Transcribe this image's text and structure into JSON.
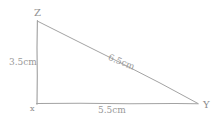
{
  "diagram": {
    "kind": "hand-drawn-right-triangle",
    "background_color": "#ffffff",
    "ink_color": "#a0a0a0",
    "vertices": [
      {
        "id": "z",
        "label": "Z",
        "x": 37,
        "y": 21
      },
      {
        "id": "x",
        "label": "x",
        "x": 37,
        "y": 104
      },
      {
        "id": "y",
        "label": "Y",
        "x": 198,
        "y": 104
      }
    ],
    "sides": [
      {
        "id": "zx",
        "from": "Z",
        "to": "x",
        "label": "3.5cm",
        "value": 3.5,
        "unit": "cm",
        "orientation": "vertical"
      },
      {
        "id": "zy",
        "from": "Z",
        "to": "Y",
        "label": "6.5cm",
        "value": 6.5,
        "unit": "cm",
        "orientation": "hypotenuse"
      },
      {
        "id": "xy",
        "from": "x",
        "to": "Y",
        "label": "5.5cm",
        "value": 5.5,
        "unit": "cm",
        "orientation": "horizontal"
      }
    ]
  }
}
